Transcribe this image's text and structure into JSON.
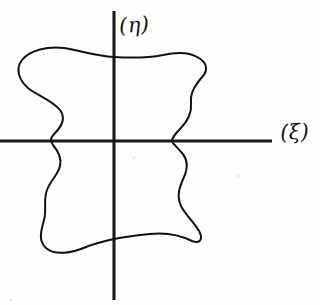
{
  "figure": {
    "background_color": "#fefefe",
    "ink_color": "#111111",
    "axis_color": "#1a1a1a",
    "width": 320,
    "height": 305
  },
  "axes": {
    "horizontal": {
      "label": "(ξ)",
      "name": "xi",
      "x_start": 0,
      "x_end": 272,
      "y": 141
    },
    "vertical": {
      "label": "(η)",
      "name": "eta",
      "x": 114,
      "y_start": 11,
      "y_end": 300
    },
    "origin": {
      "x": 114,
      "y": 141
    }
  },
  "curve": {
    "name": "closed-region-boundary",
    "closed": true,
    "stroke_color": "#111111",
    "stroke_width": 2.0,
    "bounds": {
      "left": 18,
      "right": 206,
      "top": 48,
      "bottom": 252
    },
    "axis_crossings": {
      "horizontal_left_x": 53,
      "horizontal_right_x": 172,
      "vertical_top_y": 57,
      "vertical_bottom_y": 236
    },
    "path": "M 114 57 C 95 56 78 50 64 48 C 48 46 30 50 22 60 C 15 69 19 80 28 88 C 38 96 52 100 60 110 C 66 118 62 126 55 133 C 50 138 50 141 53 145 C 58 151 62 158 60 166 C 58 175 50 181 47 190 C 43 200 47 210 44 220 C 41 231 38 241 46 248 C 55 256 72 253 86 247 C 104 240 128 236 150 234 C 168 232 182 236 192 241 C 199 244 203 240 200 233 C 196 224 186 216 181 206 C 176 195 180 186 184 177 C 188 168 188 160 182 153 C 176 146 172 143 172 141 C 172 138 175 134 180 129 C 187 122 192 113 191 103 C 190 92 196 84 203 76 C 208 70 207 63 199 58 C 190 52 176 52 163 55 C 148 58 130 58 114 57 Z"
  },
  "specks": [
    {
      "x": 133,
      "y": 157,
      "size": 2
    },
    {
      "x": 237,
      "y": 175,
      "size": 2
    },
    {
      "x": 10,
      "y": 299,
      "size": 2
    }
  ]
}
